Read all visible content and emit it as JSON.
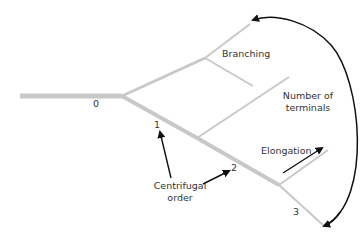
{
  "diagram": {
    "colors": {
      "branch": "#c8c8c8",
      "arrow": "#111111",
      "text": "#333333"
    },
    "orders": {
      "o0": "0",
      "o1": "1",
      "o2": "2",
      "o3": "3"
    },
    "labels": {
      "branching": "Branching",
      "terminals_line1": "Number of",
      "terminals_line2": "terminals",
      "elongation": "Elongation",
      "centrifugal_line1": "Centrifugal",
      "centrifugal_line2": "order"
    }
  }
}
